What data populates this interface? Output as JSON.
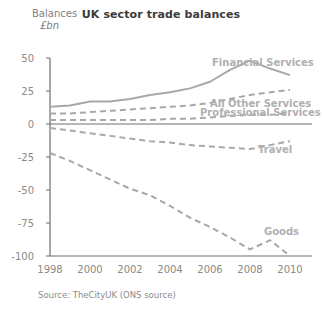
{
  "chart_data": {
    "type": "line",
    "title": "UK sector trade balances",
    "ylabel_line1": "Balances",
    "ylabel_line2": "£bn",
    "xlabel": "",
    "source": "Source: TheCityUK (ONS source)",
    "grid": false,
    "legend_position": "inline-annotations",
    "x": [
      1998,
      1999,
      2000,
      2001,
      2002,
      2003,
      2004,
      2005,
      2006,
      2007,
      2008,
      2009,
      2010
    ],
    "xtick_labels": [
      "1998",
      "2000",
      "2002",
      "2004",
      "2006",
      "2008",
      "2010"
    ],
    "xticks": [
      1998,
      2000,
      2002,
      2004,
      2006,
      2008,
      2010
    ],
    "xlim": [
      1998,
      2010
    ],
    "ytick_labels": [
      "50",
      "25",
      "0",
      "-25",
      "-50",
      "-75",
      "-100"
    ],
    "yticks": [
      50,
      25,
      0,
      -25,
      -50,
      -75,
      -100
    ],
    "ylim": [
      -100,
      50
    ],
    "series": [
      {
        "name": "Financial Services",
        "style": "solid",
        "color": "#a8a8a8",
        "label_x": 2006.1,
        "label_y": 44,
        "values": [
          13,
          14,
          17,
          17,
          19,
          22,
          24,
          27,
          32,
          41,
          48,
          42,
          37
        ]
      },
      {
        "name": "All Other Services",
        "style": "dashed",
        "color": "#a8a8a8",
        "label_x": 2006.0,
        "label_y": 13,
        "values": [
          8,
          8,
          9,
          10,
          11,
          12,
          13,
          14,
          16,
          19,
          22,
          24,
          26
        ]
      },
      {
        "name": "Professional Services",
        "style": "dashed",
        "color": "#a8a8a8",
        "label_x": 2005.5,
        "label_y": 6,
        "values": [
          3,
          3,
          3,
          3,
          3,
          3,
          4,
          4,
          5,
          6,
          7,
          7,
          8
        ]
      },
      {
        "name": "Travel",
        "style": "dashed",
        "color": "#a8a8a8",
        "label_x": 2008.4,
        "label_y": -22,
        "values": [
          -3,
          -5,
          -7,
          -9,
          -11,
          -13,
          -14,
          -16,
          -17,
          -18,
          -19,
          -16,
          -13
        ]
      },
      {
        "name": "Goods",
        "style": "dashed",
        "color": "#a8a8a8",
        "label_x": 2008.7,
        "label_y": -84,
        "values": [
          -22,
          -28,
          -35,
          -42,
          -49,
          -54,
          -62,
          -71,
          -78,
          -86,
          -95,
          -88,
          -100
        ]
      }
    ]
  }
}
